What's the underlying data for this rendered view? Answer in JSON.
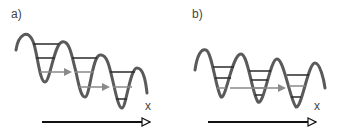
{
  "panels": [
    {
      "label": "a)",
      "axis_label": "x",
      "description": "Tilted periodic potential with quantized levels; particles tunnel to lower adjacent wells"
    },
    {
      "label": "b)",
      "axis_label": "x",
      "description": "Weakly tilted periodic potential; tunneling across two wells"
    }
  ],
  "colors": {
    "wave": "#5a5a5a",
    "levels": "#2a2a2a",
    "arrow_gray": "#8a8a8a",
    "axis": "#111111"
  }
}
